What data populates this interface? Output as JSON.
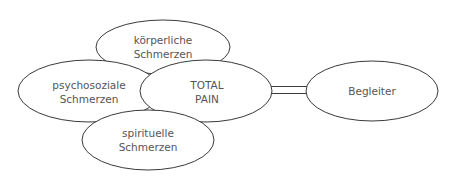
{
  "diagram": {
    "type": "concept-map",
    "nodes": [
      {
        "id": "koerperlich",
        "line1": "körperliche",
        "line2": "Schmerzen"
      },
      {
        "id": "psychosozial",
        "line1": "psychosoziale",
        "line2": "Schmerzen"
      },
      {
        "id": "total",
        "line1": "TOTAL",
        "line2": "PAIN"
      },
      {
        "id": "spirituell",
        "line1": "spirituelle",
        "line2": "Schmerzen"
      },
      {
        "id": "begleiter",
        "line1": "Begleiter",
        "line2": ""
      }
    ],
    "edges": [
      {
        "from": "total",
        "to": "begleiter",
        "style": "double-line"
      }
    ],
    "colors": {
      "stroke": "#3a3a3a",
      "text": "#555555",
      "background": "#ffffff"
    }
  }
}
